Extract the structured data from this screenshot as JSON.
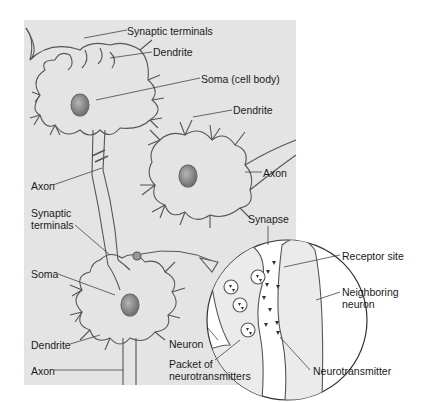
{
  "figure": {
    "background_color": "#e4e4e4",
    "line_color": "#555555",
    "nucleus_color": "#8a8a8a",
    "labels": {
      "synaptic_terminals_top": "Synaptic terminals",
      "dendrite_top": "Dendrite",
      "soma_cell_body": "Soma (cell body)",
      "dendrite_middle": "Dendrite",
      "axon_right": "Axon",
      "axon_left": "Axon",
      "synaptic_terminals_lower_line1": "Synaptic",
      "synaptic_terminals_lower_line2": "terminals",
      "soma_lower": "Soma",
      "dendrite_lower": "Dendrite",
      "axon_bottom": "Axon",
      "synapse": "Synapse",
      "receptor_site": "Receptor site",
      "neighboring_neuron_line1": "Neighboring",
      "neighboring_neuron_line2": "neuron",
      "neuron": "Neuron",
      "packet_line1": "Packet of",
      "packet_line2": "neurotransmitters",
      "neurotransmitter": "Neurotransmitter"
    }
  }
}
